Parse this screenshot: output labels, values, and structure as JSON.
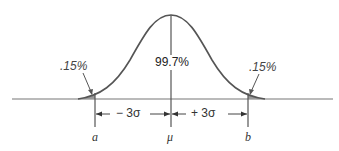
{
  "diagram": {
    "type": "normal-distribution",
    "center_label": "99.7%",
    "left_tail_label": ".15%",
    "right_tail_label": ".15%",
    "left_span_label": "− 3σ",
    "right_span_label": "+ 3σ",
    "axis_labels": {
      "left": "a",
      "center": "μ",
      "right": "b"
    },
    "colors": {
      "curve": "#555555",
      "axis": "#666666",
      "tail_fill": "#9a9a9a"
    }
  }
}
